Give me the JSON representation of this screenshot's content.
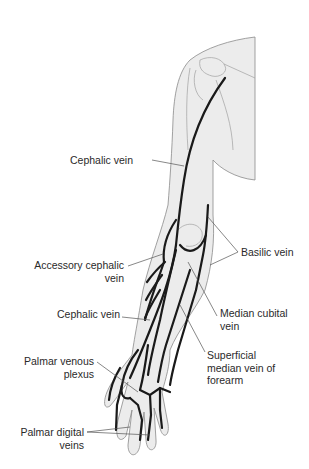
{
  "diagram": {
    "colors": {
      "skin_fill": "#ececec",
      "outline": "#8a8a8a",
      "vein": "#1a1a1a",
      "leader": "#555555",
      "text": "#2a2a2a"
    },
    "labels": [
      {
        "id": "cephalic-upper",
        "lines": [
          "Cephalic vein"
        ]
      },
      {
        "id": "basilic",
        "lines": [
          "Basilic vein"
        ]
      },
      {
        "id": "accessory-cephalic",
        "lines": [
          "Accessory cephalic",
          "vein"
        ]
      },
      {
        "id": "median-cubital",
        "lines": [
          "Median cubital",
          "vein"
        ]
      },
      {
        "id": "cephalic-lower",
        "lines": [
          "Cephalic vein"
        ]
      },
      {
        "id": "superficial-median",
        "lines": [
          "Superficial",
          "median vein of",
          "forearm"
        ]
      },
      {
        "id": "palmar-venous-plexus",
        "lines": [
          "Palmar venous",
          "plexus"
        ]
      },
      {
        "id": "palmar-digital",
        "lines": [
          "Palmar digital",
          "veins"
        ]
      }
    ]
  }
}
